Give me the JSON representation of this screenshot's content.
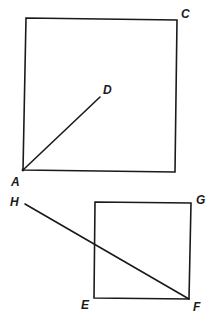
{
  "diagram": {
    "type": "geometry-figure",
    "upper_square": {
      "corners": [
        [
          26,
          18
        ],
        [
          177,
          20
        ],
        [
          175,
          172
        ],
        [
          23,
          170
        ]
      ],
      "segment_AD": {
        "from": [
          23,
          170
        ],
        "to": [
          100,
          97
        ]
      }
    },
    "lower_square": {
      "corners": [
        [
          95,
          202
        ],
        [
          191,
          203
        ],
        [
          189,
          299
        ],
        [
          94,
          298
        ]
      ],
      "segment_HF": {
        "from": [
          25,
          204
        ],
        "to": [
          189,
          299
        ]
      }
    },
    "labels": {
      "A": {
        "text": "A",
        "x": 11,
        "y": 186
      },
      "C": {
        "text": "C",
        "x": 181,
        "y": 18
      },
      "D": {
        "text": "D",
        "x": 103,
        "y": 94
      },
      "E": {
        "text": "E",
        "x": 81,
        "y": 309
      },
      "F": {
        "text": "F",
        "x": 193,
        "y": 311
      },
      "G": {
        "text": "G",
        "x": 196,
        "y": 204
      },
      "H": {
        "text": "H",
        "x": 10,
        "y": 206
      }
    },
    "stroke_color": "#1a1a1a",
    "background": "#ffffff"
  }
}
